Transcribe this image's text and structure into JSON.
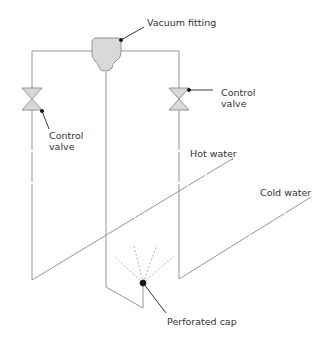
{
  "diagram": {
    "labels": {
      "vacuum_fitting": "Vacuum fitting",
      "control_valve_right_1": "Control",
      "control_valve_right_2": "valve",
      "control_valve_left_1": "Control",
      "control_valve_left_2": "valve",
      "hot_water": "Hot water",
      "cold_water": "Cold water",
      "perforated_cap": "Perforated cap"
    },
    "colors": {
      "pipe": "#8a8a8a",
      "fill": "#d9d9d9",
      "leader": "#222222"
    }
  }
}
